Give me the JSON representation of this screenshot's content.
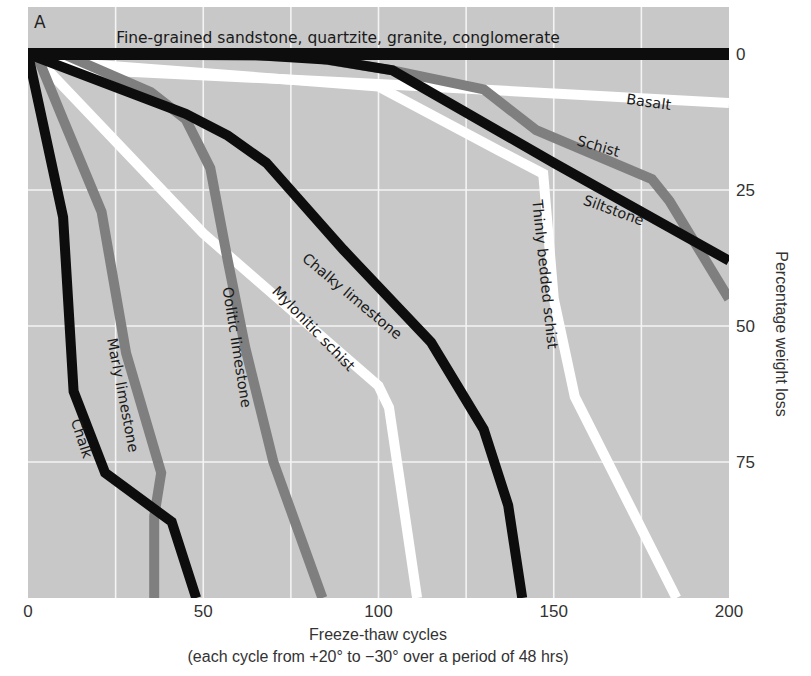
{
  "panel_label": "A",
  "colors": {
    "plot_background": "#c8c8c8",
    "grid": "#f4f4f4",
    "black": "#0d0d0d",
    "gray": "#7f7f7f",
    "white": "#ffffff"
  },
  "chart_data": {
    "type": "line",
    "title": "",
    "xlabel": "Freeze-thaw cycles",
    "xlabel_sub": "(each cycle from +20° to −30° over a period of 48 hrs)",
    "ylabel": "Percentage weight loss",
    "xlim": [
      0,
      200
    ],
    "ylim": [
      0,
      100
    ],
    "y_inverted": true,
    "y_axis_position": "right",
    "grid": true,
    "x_ticks": [
      0,
      50,
      100,
      150,
      200
    ],
    "x_tick_labels": [
      "0",
      "50",
      "100",
      "150",
      "200"
    ],
    "x_gridlines": [
      25,
      50,
      75,
      100,
      125,
      150,
      175
    ],
    "y_ticks": [
      0,
      25,
      50,
      75
    ],
    "y_tick_labels": [
      "0",
      "25",
      "50",
      "75"
    ],
    "legend": "inline labels",
    "series": [
      {
        "name": "Fine-grained sandstone, quartzite, granite, conglomerate",
        "style": "black",
        "points": [
          [
            0,
            0
          ],
          [
            200,
            0
          ]
        ]
      },
      {
        "name": "Basalt",
        "style": "white",
        "points": [
          [
            0,
            0
          ],
          [
            20,
            3
          ],
          [
            100,
            5.5
          ],
          [
            200,
            9
          ]
        ]
      },
      {
        "name": "Siltstone",
        "style": "black",
        "points": [
          [
            0,
            0
          ],
          [
            60,
            0
          ],
          [
            85,
            1
          ],
          [
            104,
            3
          ],
          [
            150,
            20
          ],
          [
            200,
            38
          ]
        ]
      },
      {
        "name": "Schist",
        "style": "gray",
        "points": [
          [
            30,
            0
          ],
          [
            80,
            0.5
          ],
          [
            104,
            3
          ],
          [
            130,
            6.5
          ],
          [
            145,
            14
          ],
          [
            178,
            23
          ],
          [
            183,
            27
          ],
          [
            200,
            45
          ]
        ]
      },
      {
        "name": "Thinly bedded schist",
        "style": "white",
        "points": [
          [
            0,
            0
          ],
          [
            20,
            2
          ],
          [
            100,
            6
          ],
          [
            135,
            18
          ],
          [
            147,
            22
          ],
          [
            150,
            45
          ],
          [
            156,
            63
          ],
          [
            185,
            100
          ]
        ]
      },
      {
        "name": "Chalky limestone",
        "style": "black",
        "points": [
          [
            0,
            0
          ],
          [
            45,
            11
          ],
          [
            57,
            15
          ],
          [
            68,
            20
          ],
          [
            90,
            36
          ],
          [
            115,
            53
          ],
          [
            130,
            69
          ],
          [
            137,
            83
          ],
          [
            141,
            100
          ]
        ]
      },
      {
        "name": "Mylonitic schist",
        "style": "white",
        "points": [
          [
            2,
            0.5
          ],
          [
            50,
            33
          ],
          [
            100,
            61
          ],
          [
            103,
            65
          ],
          [
            111,
            100
          ]
        ]
      },
      {
        "name": "Oolitic limestone",
        "style": "gray",
        "points": [
          [
            10,
            0
          ],
          [
            35,
            7
          ],
          [
            45,
            12
          ],
          [
            52,
            21
          ],
          [
            57,
            38
          ],
          [
            62,
            54
          ],
          [
            70,
            75
          ],
          [
            84,
            100
          ]
        ]
      },
      {
        "name": "Marly limestone",
        "style": "gray",
        "points": [
          [
            3,
            1
          ],
          [
            10,
            12
          ],
          [
            21,
            29
          ],
          [
            28,
            55
          ],
          [
            38,
            77
          ],
          [
            36,
            85
          ],
          [
            36,
            100
          ]
        ]
      },
      {
        "name": "Chalk",
        "style": "black",
        "points": [
          [
            0,
            0
          ],
          [
            10,
            30
          ],
          [
            13,
            62
          ],
          [
            22,
            77
          ],
          [
            41,
            86
          ],
          [
            48,
            100
          ]
        ]
      }
    ],
    "annotations": [
      {
        "text": "Fine-grained sandstone, quartzite, granite, conglomerate",
        "x": 338,
        "y": 43,
        "angle": 0,
        "cls": "top-label"
      },
      {
        "text": "Basalt",
        "x": 648,
        "y": 107,
        "angle": 8
      },
      {
        "text": "Schist",
        "x": 597,
        "y": 151,
        "angle": 16
      },
      {
        "text": "Siltstone",
        "x": 612,
        "y": 215,
        "angle": 20
      },
      {
        "text": "Thinly bedded schist",
        "x": 540,
        "y": 275,
        "angle": 84
      },
      {
        "text": "Chalky limestone",
        "x": 349,
        "y": 300,
        "angle": 40
      },
      {
        "text": "Mylonitic schist",
        "x": 310,
        "y": 332,
        "angle": 46
      },
      {
        "text": "Oolitic limestone",
        "x": 232,
        "y": 348,
        "angle": 81
      },
      {
        "text": "Marly limestone",
        "x": 118,
        "y": 396,
        "angle": 79
      },
      {
        "text": "Chalk",
        "x": 77,
        "y": 440,
        "angle": 72
      }
    ]
  }
}
